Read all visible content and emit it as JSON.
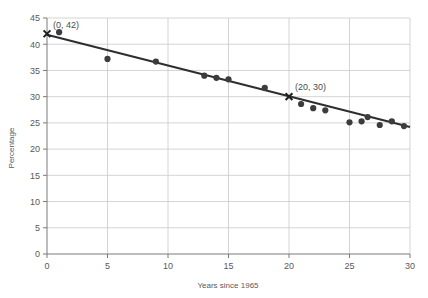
{
  "chart_data": {
    "type": "scatter",
    "title": "",
    "xlabel": "Years since 1965",
    "ylabel": "Percentage",
    "xlim": [
      0,
      30
    ],
    "ylim": [
      0,
      45
    ],
    "xticks": [
      0,
      5,
      10,
      15,
      20,
      25,
      30
    ],
    "yticks": [
      0,
      5,
      10,
      15,
      20,
      25,
      30,
      35,
      40,
      45
    ],
    "grid": true,
    "legend": "none",
    "colors": {
      "point": "#3c3c3e",
      "line": "#2e2e30",
      "grid": "#c9c9cc",
      "axis": "#7a7a7d",
      "background": "#ffffff"
    },
    "series": [
      {
        "name": "observations",
        "marker": "circle",
        "x": [
          1,
          5,
          9,
          13,
          14,
          15,
          18,
          21,
          22,
          23,
          25,
          26,
          26.5,
          27.5,
          28.5,
          29.5
        ],
        "y": [
          42.3,
          37.2,
          36.7,
          34.0,
          33.6,
          33.3,
          31.7,
          28.6,
          27.8,
          27.4,
          25.1,
          25.3,
          26.1,
          24.6,
          25.3,
          24.4
        ]
      },
      {
        "name": "line-of-best-fit",
        "marker": "none",
        "x": [
          0,
          30
        ],
        "y": [
          41.8,
          24.2
        ]
      }
    ],
    "annotations": [
      {
        "label": "(0, 42)",
        "x": 0,
        "y": 42,
        "marker": "x",
        "label_dx": 6,
        "label_dy": -6
      },
      {
        "label": "(20, 30)",
        "x": 20,
        "y": 30,
        "marker": "x",
        "label_dx": 6,
        "label_dy": -7
      }
    ],
    "xtick_labels": [
      "0",
      "5",
      "10",
      "15",
      "20",
      "25",
      "30"
    ],
    "ytick_labels": [
      "0",
      "5",
      "10",
      "15",
      "20",
      "25",
      "30",
      "35",
      "40",
      "45"
    ]
  }
}
